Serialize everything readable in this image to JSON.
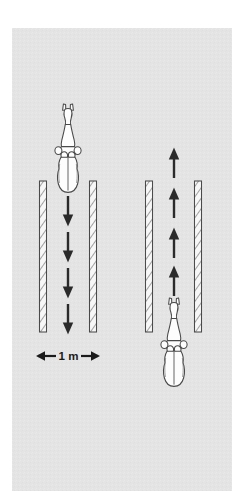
{
  "figure": {
    "canvas": {
      "width": 244,
      "height": 491,
      "background": "#ffffff"
    },
    "panel": {
      "x": 12,
      "y": 28,
      "width": 220,
      "height": 463,
      "fill": "#e4e4e4",
      "label": "light gray diagram panel"
    },
    "colors": {
      "panel_fill": "#e4e4e4",
      "arrow": "#2a2a2a",
      "barrier_outline": "#4a4a4a",
      "barrier_fill": "#f7f7f7",
      "barrier_hatch": "#8c8c8c",
      "animal_outline": "#4a4a4a",
      "animal_fill": "#fdfdfd",
      "scale_text": "#1a1a1a"
    },
    "lanes": [
      {
        "id": "left-lane",
        "name": "left lane",
        "direction": "down",
        "direction_label": "downward",
        "arrow_count": 4,
        "barrier_left_x": 43,
        "barrier_right_x": 93,
        "barrier_top_y": 181,
        "barrier_bottom_y": 332,
        "lane_center_x": 68,
        "animal_position": "top",
        "animal_heading": "head-up",
        "arrows_y": [
          196,
          232,
          268,
          304
        ]
      },
      {
        "id": "right-lane",
        "name": "right lane",
        "direction": "up",
        "direction_label": "upward",
        "arrow_count": 4,
        "barrier_left_x": 149,
        "barrier_right_x": 198,
        "barrier_top_y": 181,
        "barrier_bottom_y": 332,
        "lane_center_x": 174,
        "animal_position": "bottom",
        "animal_heading": "head-up",
        "arrows_y": [
          148,
          188,
          228,
          268
        ]
      }
    ],
    "animals": [
      {
        "id": "animal-left",
        "name": "horse-top-down-left",
        "center_x": 68,
        "head_y": 104,
        "tail_y": 192,
        "scale": 1.0
      },
      {
        "id": "animal-right",
        "name": "horse-top-down-right",
        "center_x": 174,
        "head_y": 298,
        "tail_y": 386,
        "scale": 1.0
      }
    ],
    "scale_bar": {
      "label": "1 m",
      "left_arrow_glyph": "←",
      "right_arrow_glyph": "→",
      "x_start": 36,
      "x_end": 100,
      "y": 356,
      "text_size": 11
    }
  }
}
